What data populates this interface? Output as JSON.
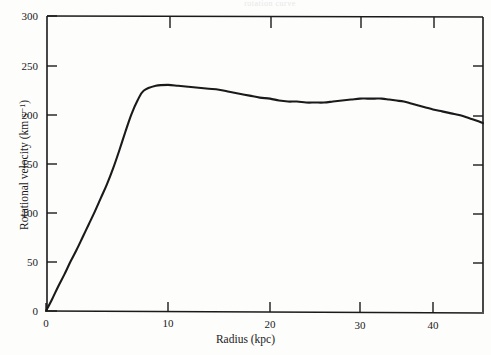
{
  "figure": {
    "background_color": "#fdfdfc",
    "line_color": "#1a1a1a",
    "header_remnant": "rotation curve"
  },
  "chart_data": {
    "type": "line",
    "title": "",
    "xlabel": "Radius (kpc)",
    "ylabel": "Rotational velocity (km s⁻¹)",
    "ylabel_plain": "Rotational velocity (km s-1)",
    "xlim": [
      0,
      45.5
    ],
    "ylim": [
      0,
      300
    ],
    "xticks": [
      0,
      10,
      20,
      30,
      40
    ],
    "xtick_labels": [
      "0",
      "10",
      "20",
      "30",
      "40"
    ],
    "yticks": [
      0,
      50,
      100,
      150,
      200,
      250,
      300
    ],
    "ytick_labels": [
      "0",
      "50",
      "100",
      "150",
      "200",
      "250",
      "300"
    ],
    "grid": false,
    "legend": "none",
    "series": [
      {
        "name": "Rotation curve",
        "x": [
          0,
          0.5,
          1,
          1.5,
          2,
          2.5,
          3,
          3.5,
          4,
          4.5,
          5,
          5.5,
          6,
          6.5,
          7,
          7.5,
          8,
          9,
          10,
          11,
          12,
          13,
          14,
          15,
          16,
          17,
          18,
          19,
          20,
          21,
          22,
          23,
          24,
          25,
          26,
          27,
          28,
          29,
          30,
          31,
          32,
          33,
          34,
          35,
          36,
          37,
          38,
          39,
          40,
          41,
          42,
          43,
          44,
          45,
          45.5
        ],
        "y": [
          0,
          12,
          25,
          37,
          50,
          62,
          75,
          88,
          101,
          115,
          129,
          145,
          163,
          182,
          200,
          214,
          224,
          229,
          230,
          229,
          228,
          227,
          226,
          225,
          223,
          221,
          219,
          217,
          216,
          214,
          213,
          213,
          212,
          212,
          212,
          213,
          214,
          215,
          216,
          216,
          216,
          216,
          215,
          214,
          213,
          211,
          209,
          207,
          205,
          203,
          201,
          199,
          196,
          193,
          191
        ]
      }
    ],
    "notes": {
      "peak_velocity": 230,
      "peak_radius": 8,
      "plateau_velocity_range": [
        212,
        230
      ],
      "final_velocity": 191,
      "final_radius": 45.5
    }
  },
  "axes_pixels": {
    "x0": 46,
    "x_right": 483,
    "y0": 311,
    "y_top": 16,
    "xtick_px": [
      46,
      168,
      270,
      360,
      433
    ],
    "ytick_px": [
      311,
      262,
      213,
      164,
      115,
      66,
      16
    ]
  }
}
